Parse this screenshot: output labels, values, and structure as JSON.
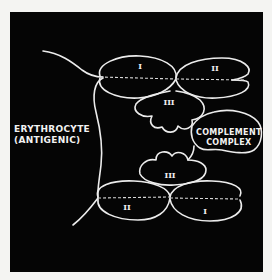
{
  "diagram": {
    "background_color": "#050505",
    "stroke_color": "#ececec",
    "labels": {
      "erythrocyte_line1": "ERYTHROCYTE",
      "erythrocyte_line2": "(ANTIGENIC)",
      "complement_line1": "COMPLEMENT",
      "complement_line2": "COMPLEX"
    },
    "top_molecule": {
      "lobe_1": "I",
      "lobe_2": "II",
      "lobe_3": "III"
    },
    "bottom_molecule": {
      "lobe_1": "I",
      "lobe_2": "II",
      "lobe_3": "III"
    }
  }
}
